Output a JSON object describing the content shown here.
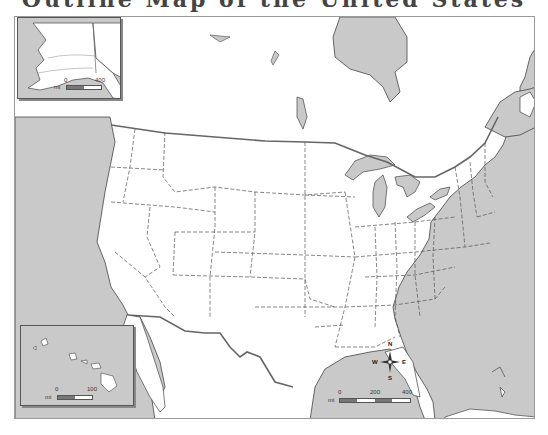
{
  "title": {
    "text": "Outline Map of the United States"
  },
  "map": {
    "colors": {
      "water": "#c9c9c9",
      "land": "#ffffff",
      "border": "#555555",
      "state_line": "#555555",
      "frame": "#9a9a9a"
    },
    "main_scale": {
      "unit": "mi",
      "ticks": [
        "0",
        "200",
        "400"
      ]
    },
    "compass": {
      "n": "N",
      "s": "S",
      "e": "E",
      "w": "W"
    },
    "alaska_inset": {
      "scale_unit": "mi",
      "ticks": [
        "0",
        "400"
      ]
    },
    "hawaii_inset": {
      "scale_unit": "mi",
      "ticks": [
        "0",
        "100"
      ]
    }
  }
}
